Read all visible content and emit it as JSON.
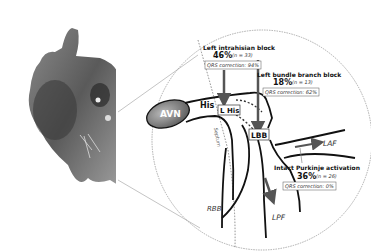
{
  "labels": {
    "avn": "AVN",
    "his": "His",
    "l_his": "L His",
    "lbb": "LBB",
    "laf": "LAF",
    "lpf": "LPF",
    "rbb": "RBB",
    "septum": "Septum"
  },
  "blocks": [
    {
      "title": "Left intrahisian block",
      "percent": "46%",
      "n": "(n = 33)",
      "qrs": "QRS correction: 94%"
    },
    {
      "title": "Left bundle branch block",
      "percent": "18%",
      "n": "(n = 13)",
      "qrs": "QRS correction: 62%"
    },
    {
      "title": "Intact Purkinje activation",
      "percent": "36%",
      "n": "(n = 26)",
      "qrs": "QRS correction: 0%"
    }
  ],
  "colors": {
    "line": "#111111",
    "arrow": "#555555",
    "avn_fill": "#777777",
    "circle": "#999999"
  }
}
